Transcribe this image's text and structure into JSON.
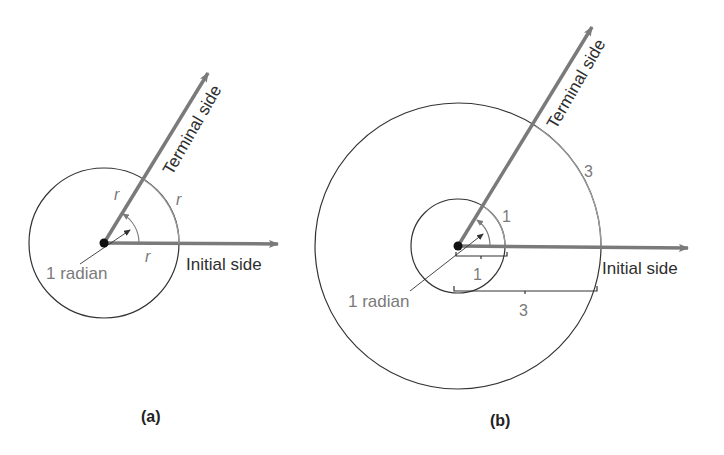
{
  "figure_a": {
    "caption": "(a)",
    "terminal_label": "Terminal side",
    "initial_label": "Initial side",
    "angle_label": "1 radian",
    "radius_label_terminal": "r",
    "arc_label": "r",
    "radius_label_initial": "r"
  },
  "figure_b": {
    "caption": "(b)",
    "terminal_label": "Terminal side",
    "initial_label": "Initial side",
    "angle_label": "1 radian",
    "small_arc_label": "1",
    "large_arc_label": "3",
    "small_radius_label": "1",
    "large_radius_label": "3"
  },
  "colors": {
    "ray": "#7a7a7a",
    "circle": "#333333",
    "dot": "#111111",
    "text_dark": "#2e2e2e",
    "text_gray": "#7a7a7a"
  }
}
